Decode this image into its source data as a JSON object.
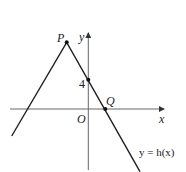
{
  "diagram": {
    "type": "coordinate-graph",
    "function_label": "y = h(x)",
    "axes": {
      "x_label": "x",
      "y_label": "y",
      "origin_label": "O"
    },
    "points": [
      {
        "name": "P",
        "description": "vertex (maximum) of the graph, in second quadrant"
      },
      {
        "name": "Q",
        "description": "x-intercept on positive x-axis"
      },
      {
        "name": "4",
        "description": "y-intercept at (0, 4)"
      }
    ],
    "y_intercept_label": "4",
    "colors": {
      "line": "#222222",
      "axis": "#555555",
      "background": "#ffffff"
    }
  }
}
